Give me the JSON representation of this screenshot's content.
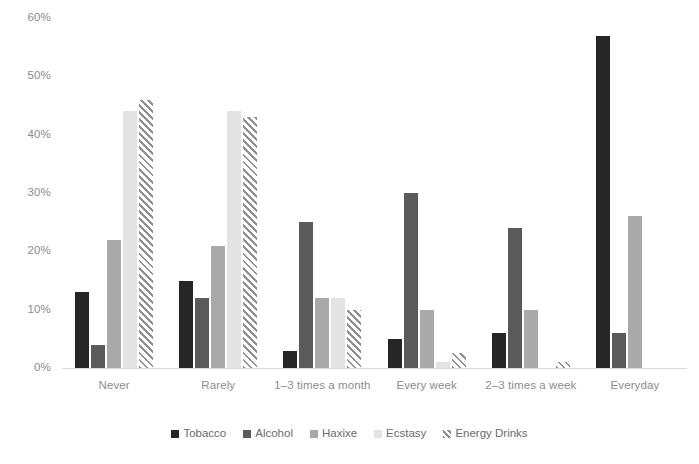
{
  "chart_data": {
    "type": "bar",
    "title": "",
    "subtitle": "",
    "xlabel": "",
    "ylabel": "",
    "ylim": [
      0,
      60
    ],
    "ytick_labels": [
      "60%",
      "50%",
      "40%",
      "30%",
      "20%",
      "10%",
      "0%"
    ],
    "ytick_values": [
      60,
      50,
      40,
      30,
      20,
      10,
      0
    ],
    "grid": false,
    "legend_position": "bottom",
    "value_suffix": "%",
    "categories": [
      "Never",
      "Rarely",
      "1–3 times a month",
      "Every week",
      "2–3 times a week",
      "Everyday"
    ],
    "series": [
      {
        "name": "Tobacco",
        "color": "#262626",
        "pattern": "solid",
        "values": [
          13,
          15,
          3,
          5,
          6,
          57
        ]
      },
      {
        "name": "Alcohol",
        "color": "#5a5a5a",
        "pattern": "solid",
        "values": [
          4,
          12,
          25,
          30,
          24,
          6
        ]
      },
      {
        "name": "Haxixe",
        "color": "#a9a9a9",
        "pattern": "solid",
        "values": [
          22,
          21,
          12,
          10,
          10,
          26
        ]
      },
      {
        "name": "Ecstasy",
        "color": "#e3e3e3",
        "pattern": "solid",
        "values": [
          44,
          44,
          12,
          1,
          0,
          0
        ]
      },
      {
        "name": "Energy Drinks",
        "color": "#8f8f8f",
        "pattern": "diagonal-hatch",
        "values": [
          46,
          43,
          10,
          2.5,
          1,
          0
        ]
      }
    ]
  }
}
